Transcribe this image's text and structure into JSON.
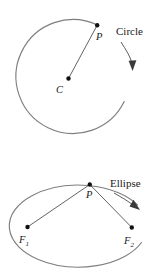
{
  "figure": {
    "title": "",
    "stroke_color": "#7e7e7e",
    "line_color": "#3a3a3a",
    "label_color": "#1a1a1a",
    "panels": [
      {
        "name": "circle-panel",
        "caption": "Circle",
        "points": [
          {
            "id": "center",
            "label": "C",
            "sub": "",
            "x": 68,
            "y": 79
          },
          {
            "id": "on-curve",
            "label": "P",
            "sub": "",
            "x": 97,
            "y": 25
          }
        ],
        "segments": [
          {
            "from": "center",
            "to": "on-curve"
          }
        ]
      },
      {
        "name": "ellipse-panel",
        "caption": "Ellipse",
        "points": [
          {
            "id": "focus-1",
            "label": "F",
            "sub": "1",
            "x": 27,
            "y": 227
          },
          {
            "id": "focus-2",
            "label": "F",
            "sub": "2",
            "x": 132,
            "y": 228
          },
          {
            "id": "on-curve",
            "label": "P",
            "sub": "",
            "x": 90,
            "y": 184
          }
        ],
        "segments": [
          {
            "from": "focus-1",
            "to": "on-curve"
          },
          {
            "from": "on-curve",
            "to": "focus-2"
          }
        ]
      }
    ],
    "labels": {
      "circle_caption": "Circle",
      "ellipse_caption": "Ellipse",
      "center_label": "C",
      "point_label": "P",
      "focus1_label": "F",
      "focus1_sub": "1",
      "focus2_label": "F",
      "focus2_sub": "2"
    }
  }
}
